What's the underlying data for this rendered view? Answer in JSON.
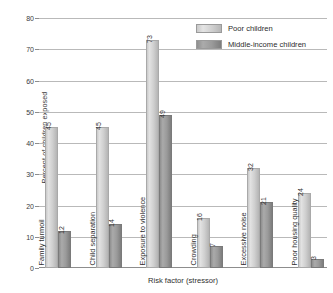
{
  "chart_data": {
    "type": "bar",
    "title": "",
    "xlabel": "Risk factor (stressor)",
    "ylabel": "Percent of children exposed",
    "ylim": [
      0,
      80
    ],
    "yticks": [
      0,
      10,
      20,
      30,
      40,
      50,
      60,
      70,
      80
    ],
    "grid": true,
    "legend_position": "top-right",
    "categories": [
      "Family turmoil",
      "Child separation",
      "Exposure to violence",
      "Crowding",
      "Excessive noise",
      "Poor housing quality"
    ],
    "series": [
      {
        "name": "Poor children",
        "color": "#cfcfcf",
        "values": [
          45,
          45,
          73,
          16,
          32,
          24
        ]
      },
      {
        "name": "Middle-income children",
        "color": "#949494",
        "values": [
          12,
          14,
          49,
          7,
          21,
          3
        ]
      }
    ]
  },
  "legend": {
    "items": [
      {
        "label": "Poor children"
      },
      {
        "label": "Middle-income children"
      }
    ]
  }
}
